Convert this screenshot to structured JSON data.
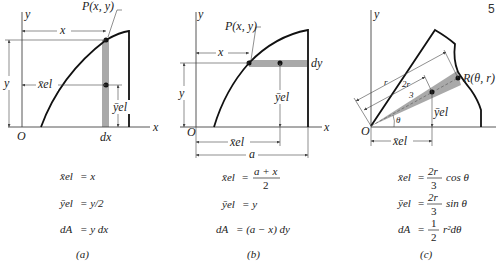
{
  "page_number": "5",
  "panels": [
    {
      "id": "a",
      "caption": "(a)",
      "labels": {
        "y_axis": "y",
        "x_axis": "x",
        "origin": "O",
        "point": "P(x, y)",
        "x_dim": "x",
        "y_dim": "y",
        "xel": "x̄el",
        "yel": "ȳel",
        "strip_width": "dx"
      },
      "equations": [
        {
          "lhs": "x̄el",
          "rhs": "= x"
        },
        {
          "lhs": "ȳel",
          "rhs": "= y/2"
        },
        {
          "lhs": "dA",
          "rhs": "= y dx"
        }
      ]
    },
    {
      "id": "b",
      "caption": "(b)",
      "labels": {
        "y_axis": "y",
        "x_axis": "x",
        "origin": "O",
        "point": "P(x, y)",
        "x_dim": "x",
        "y_dim": "y",
        "xel": "x̄el",
        "yel": "ȳel",
        "strip_width": "dy",
        "a_dim": "a"
      },
      "equations": [
        {
          "lhs": "x̄el",
          "rhs_num": "a + x",
          "rhs_den": "2"
        },
        {
          "lhs": "ȳel",
          "rhs": "= y"
        },
        {
          "lhs": "dA",
          "rhs": "= (a − x) dy"
        }
      ]
    },
    {
      "id": "c",
      "caption": "(c)",
      "labels": {
        "y_axis": "y",
        "x_axis": "x",
        "origin": "O",
        "point": "R(θ, r)",
        "r_dim": "r",
        "two_thirds_r": "2r",
        "two_thirds_den": "3",
        "theta": "θ",
        "xel": "x̄el",
        "yel": "ȳel"
      },
      "equations": [
        {
          "lhs": "x̄el",
          "num": "2r",
          "den": "3",
          "tail": "cos θ"
        },
        {
          "lhs": "ȳel",
          "num": "2r",
          "den": "3",
          "tail": "sin θ"
        },
        {
          "lhs": "dA",
          "num": "1",
          "den": "2",
          "tail": "r²dθ"
        }
      ]
    }
  ]
}
